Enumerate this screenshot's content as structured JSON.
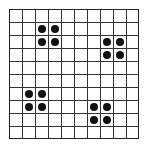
{
  "grid": {
    "rows": 10,
    "cols": 10,
    "cell_px": 13,
    "line_color": "#333333",
    "dot_color": "#111111"
  },
  "dots": [
    {
      "row": 1,
      "col": 2
    },
    {
      "row": 1,
      "col": 3
    },
    {
      "row": 2,
      "col": 2
    },
    {
      "row": 2,
      "col": 3
    },
    {
      "row": 2,
      "col": 7
    },
    {
      "row": 2,
      "col": 8
    },
    {
      "row": 3,
      "col": 7
    },
    {
      "row": 3,
      "col": 8
    },
    {
      "row": 6,
      "col": 1
    },
    {
      "row": 6,
      "col": 2
    },
    {
      "row": 7,
      "col": 1
    },
    {
      "row": 7,
      "col": 2
    },
    {
      "row": 7,
      "col": 6
    },
    {
      "row": 7,
      "col": 7
    },
    {
      "row": 8,
      "col": 6
    },
    {
      "row": 8,
      "col": 7
    }
  ]
}
